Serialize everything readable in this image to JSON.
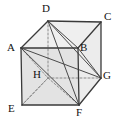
{
  "figure": {
    "name": "labelled-cube",
    "type": "geometry-diagram",
    "background_color": "#ffffff",
    "canvas": {
      "width": 116,
      "height": 122
    }
  },
  "style": {
    "edge_color": "#3a3a3a",
    "hidden_edge_color": "#8a8a8a",
    "diagonal_color": "#4a4a4a",
    "label_color": "#111111",
    "face_top_color": "#eeeeee",
    "face_front_color": "#e2e2e2",
    "face_right_color": "#e9e9e9",
    "face_left_color": "#dcdcdc",
    "face_bottom_color": "#e5e5e5",
    "edge_width": 1.3,
    "hidden_edge_width": 1.0,
    "diagonal_width": 1.0,
    "label_font_size": 11
  },
  "vertices": [
    {
      "id": "A",
      "label": "A",
      "x": 21,
      "y": 48,
      "label_x": 7,
      "label_y": 42,
      "hidden": false
    },
    {
      "id": "B",
      "label": "B",
      "x": 78,
      "y": 48,
      "label_x": 80,
      "label_y": 42,
      "hidden": false
    },
    {
      "id": "C",
      "label": "C",
      "x": 101,
      "y": 22,
      "label_x": 104,
      "label_y": 11,
      "hidden": false
    },
    {
      "id": "D",
      "label": "D",
      "x": 48,
      "y": 21,
      "label_x": 42,
      "label_y": 3,
      "hidden": false
    },
    {
      "id": "E",
      "label": "E",
      "x": 22,
      "y": 105,
      "label_x": 8,
      "label_y": 103,
      "hidden": false
    },
    {
      "id": "F",
      "label": "F",
      "x": 79,
      "y": 105,
      "label_x": 76,
      "label_y": 107,
      "hidden": false
    },
    {
      "id": "G",
      "label": "G",
      "x": 101,
      "y": 78,
      "label_x": 103,
      "label_y": 70,
      "hidden": false
    },
    {
      "id": "H",
      "label": "H",
      "x": 48,
      "y": 78,
      "label_x": 33,
      "label_y": 69,
      "hidden": true
    }
  ],
  "faces": [
    {
      "name": "face-top-ADCB",
      "path": "A D C B",
      "color": "#efefef"
    },
    {
      "name": "face-front-ABFE",
      "path": "A B F E",
      "color": "#e3e3e3"
    },
    {
      "name": "face-right-BCGF",
      "path": "B C G F",
      "color": "#ececec"
    }
  ],
  "edges": [
    {
      "name": "edge-A-D",
      "from": "A",
      "to": "D",
      "hidden": false
    },
    {
      "name": "edge-D-C",
      "from": "D",
      "to": "C",
      "hidden": false
    },
    {
      "name": "edge-C-B",
      "from": "C",
      "to": "B",
      "hidden": false
    },
    {
      "name": "edge-B-A",
      "from": "B",
      "to": "A",
      "hidden": false
    },
    {
      "name": "edge-A-E",
      "from": "A",
      "to": "E",
      "hidden": false
    },
    {
      "name": "edge-B-F",
      "from": "B",
      "to": "F",
      "hidden": false
    },
    {
      "name": "edge-C-G",
      "from": "C",
      "to": "G",
      "hidden": false
    },
    {
      "name": "edge-E-F",
      "from": "E",
      "to": "F",
      "hidden": false
    },
    {
      "name": "edge-F-G",
      "from": "F",
      "to": "G",
      "hidden": false
    },
    {
      "name": "edge-D-H",
      "from": "D",
      "to": "H",
      "hidden": true
    },
    {
      "name": "edge-H-E",
      "from": "H",
      "to": "E",
      "hidden": true
    },
    {
      "name": "edge-H-G",
      "from": "H",
      "to": "G",
      "hidden": true
    }
  ],
  "diagonals": [
    {
      "name": "diagonal-D-B",
      "from": "D",
      "to": "B",
      "hidden": false
    },
    {
      "name": "diagonal-D-F",
      "from": "D",
      "to": "F",
      "hidden": false
    },
    {
      "name": "diagonal-D-G",
      "from": "D",
      "to": "G",
      "hidden": false
    },
    {
      "name": "diagonal-A-G",
      "from": "A",
      "to": "G",
      "hidden": false
    },
    {
      "name": "diagonal-A-F",
      "from": "A",
      "to": "F",
      "hidden": false
    },
    {
      "name": "diagonal-A-H",
      "from": "A",
      "to": "H",
      "hidden": true
    },
    {
      "name": "diagonal-H-F",
      "from": "H",
      "to": "F",
      "hidden": true
    },
    {
      "name": "diagonal-B-G",
      "from": "B",
      "to": "G",
      "hidden": false
    },
    {
      "name": "diagonal-E-H",
      "from": "E",
      "to": "H",
      "hidden": true
    }
  ]
}
